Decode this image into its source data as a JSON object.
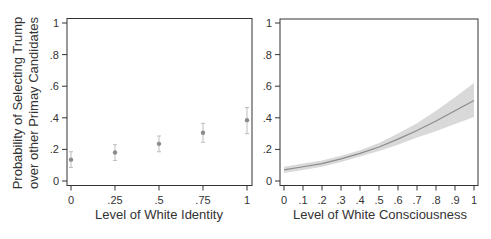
{
  "chart_data": [
    {
      "type": "scatter",
      "panel": "left",
      "title": "",
      "xlabel": "Level of White Identity",
      "ylabel_lines": [
        "Probability of Selecting Trump",
        "over other Primay Candidates"
      ],
      "x_ticks": [
        "0",
        ".25",
        ".5",
        ".75",
        "1"
      ],
      "y_ticks": [
        "0",
        ".2",
        ".4",
        ".6",
        ".8",
        "1"
      ],
      "xlim": [
        0,
        1
      ],
      "ylim": [
        0,
        1
      ],
      "grid": false,
      "points": [
        {
          "x": 0,
          "y": 0.135,
          "lo": 0.085,
          "hi": 0.185
        },
        {
          "x": 0.25,
          "y": 0.18,
          "lo": 0.13,
          "hi": 0.23
        },
        {
          "x": 0.5,
          "y": 0.235,
          "lo": 0.185,
          "hi": 0.285
        },
        {
          "x": 0.75,
          "y": 0.305,
          "lo": 0.245,
          "hi": 0.365
        },
        {
          "x": 1,
          "y": 0.385,
          "lo": 0.3,
          "hi": 0.465
        }
      ],
      "color": "#8c8c8c"
    },
    {
      "type": "area",
      "panel": "right",
      "title": "",
      "xlabel": "Level of White Consciousness",
      "x_ticks": [
        "0",
        ".1",
        ".2",
        ".3",
        ".4",
        ".5",
        ".6",
        ".7",
        ".8",
        ".9",
        "1"
      ],
      "y_ticks": [
        "0",
        ".2",
        ".4",
        ".6",
        ".8",
        "1"
      ],
      "xlim": [
        0,
        1
      ],
      "ylim": [
        0,
        1
      ],
      "grid": false,
      "x": [
        0,
        0.1,
        0.2,
        0.3,
        0.4,
        0.5,
        0.6,
        0.7,
        0.8,
        0.9,
        1.0
      ],
      "series": [
        {
          "name": "predicted",
          "values": [
            0.07,
            0.09,
            0.11,
            0.14,
            0.175,
            0.215,
            0.265,
            0.32,
            0.38,
            0.445,
            0.51
          ]
        },
        {
          "name": "ci_lower",
          "values": [
            0.05,
            0.07,
            0.09,
            0.12,
            0.155,
            0.19,
            0.23,
            0.275,
            0.315,
            0.36,
            0.405
          ]
        },
        {
          "name": "ci_upper",
          "values": [
            0.09,
            0.11,
            0.13,
            0.16,
            0.195,
            0.24,
            0.3,
            0.365,
            0.445,
            0.53,
            0.62
          ]
        }
      ],
      "line_color": "#8c8c8c",
      "band_color": "#d9d9d9"
    }
  ]
}
